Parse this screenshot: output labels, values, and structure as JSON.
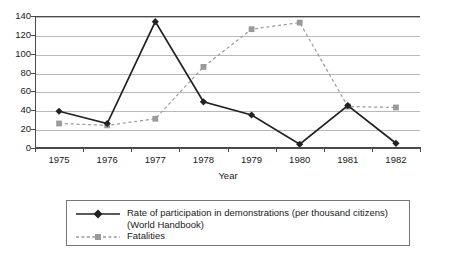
{
  "chart_data": {
    "type": "line",
    "title": "",
    "xlabel": "Year",
    "ylabel": "",
    "categories": [
      "1975",
      "1976",
      "1977",
      "1978",
      "1979",
      "1980",
      "1981",
      "1982"
    ],
    "x": [
      1975,
      1976,
      1977,
      1978,
      1979,
      1980,
      1981,
      1982
    ],
    "ylim": [
      0,
      140
    ],
    "yticks": [
      0,
      20,
      40,
      60,
      80,
      100,
      120,
      140
    ],
    "ytick_labels": [
      "0",
      "20",
      "40",
      "60",
      "80",
      "100",
      "120",
      "140"
    ],
    "grid": true,
    "legend_position": "bottom",
    "series": [
      {
        "name": "Rate of participation in demonstrations (per thousand citizens) (World Handbook)",
        "name_line1": "Rate of participation in demonstrations (per thousand citizens)",
        "name_line2": "(World Handbook)",
        "marker": "diamond",
        "linestyle": "solid",
        "color": "#222222",
        "values": [
          39,
          26,
          134,
          49,
          35,
          4,
          45,
          5
        ]
      },
      {
        "name": "Fatalities",
        "name_line1": "Fatalities",
        "name_line2": "",
        "marker": "square",
        "linestyle": "dashed",
        "color": "#9a9a9a",
        "values": [
          26,
          24,
          31,
          86,
          126,
          133,
          44,
          43
        ]
      }
    ]
  },
  "axis": {
    "x_title": "Year"
  },
  "colors": {
    "series1": "#222222",
    "series2": "#9a9a9a",
    "grid": "#b9b9b9",
    "axis": "#4a4a4a",
    "legend_border": "#767676",
    "background": "#ffffff"
  }
}
